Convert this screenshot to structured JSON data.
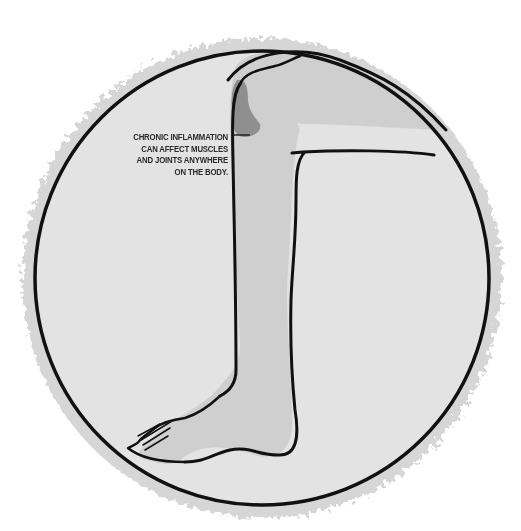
{
  "illustration": {
    "subject": "leg-with-knee-inflammation",
    "caption_lines": [
      "CHRONIC INFLAMMATION",
      "CAN AFFECT MUSCLES",
      "AND JOINTS ANYWHERE",
      "ON THE BODY."
    ],
    "colors": {
      "background": "#ffffff",
      "halo": "#d6d6d6",
      "circle_fill": "#e3e3e3",
      "leg_fill": "#cfcfcf",
      "inflammation": "#8f8f8f",
      "outline": "#111111"
    }
  }
}
